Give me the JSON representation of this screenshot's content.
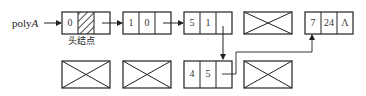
{
  "diagram": {
    "pointer_label": {
      "prefix": "poly",
      "italic": "A"
    },
    "head_node_label": "头结点",
    "stroke_color": "#222222",
    "row1": [
      {
        "id": "head",
        "type": "node",
        "cells": [
          "0",
          "",
          ""
        ],
        "hatched_cell": 1
      },
      {
        "id": "n1",
        "type": "node",
        "cells": [
          "1",
          "0",
          ""
        ]
      },
      {
        "id": "n2",
        "type": "node",
        "cells": [
          "5",
          "1",
          ""
        ]
      },
      {
        "id": "free1",
        "type": "empty"
      },
      {
        "id": "n4",
        "type": "node",
        "cells": [
          "7",
          "24",
          "Λ"
        ]
      }
    ],
    "row2": [
      {
        "id": "free2",
        "type": "empty"
      },
      {
        "id": "free3",
        "type": "empty"
      },
      {
        "id": "n3",
        "type": "node",
        "cells": [
          "4",
          "5",
          ""
        ]
      },
      {
        "id": "free4",
        "type": "empty"
      }
    ]
  }
}
